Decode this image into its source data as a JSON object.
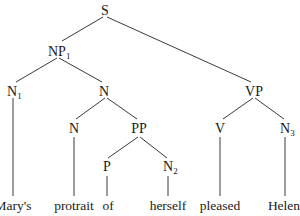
{
  "tree": {
    "nodes": {
      "S": {
        "label": "S",
        "sub": ""
      },
      "NP1": {
        "label": "NP",
        "sub": "1"
      },
      "N1": {
        "label": "N",
        "sub": "1"
      },
      "Nmid": {
        "label": "N",
        "sub": ""
      },
      "VP": {
        "label": "VP",
        "sub": ""
      },
      "Nhead": {
        "label": "N",
        "sub": ""
      },
      "PP": {
        "label": "PP",
        "sub": ""
      },
      "V": {
        "label": "V",
        "sub": ""
      },
      "N3": {
        "label": "N",
        "sub": "3"
      },
      "P": {
        "label": "P",
        "sub": ""
      },
      "N2": {
        "label": "N",
        "sub": "2"
      }
    },
    "words": [
      "Mary's",
      "protrait",
      "of",
      "herself",
      "pleased",
      "Helen"
    ]
  }
}
